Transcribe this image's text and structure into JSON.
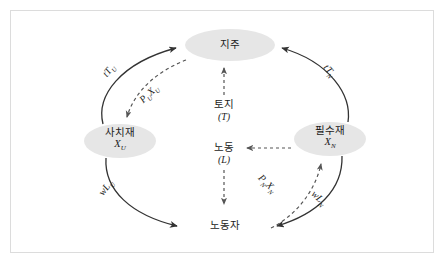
{
  "figure": {
    "type": "circular-flow-diagram",
    "background_color": "#ffffff",
    "frame_border_color": "#dcdcdc",
    "node_fill_color": "#e6e6e6",
    "solid_edge_color": "#333333",
    "dashed_edge_color": "#555555",
    "text_color": "#1b1b1b"
  },
  "nodes": [
    {
      "id": "landlord",
      "name": "지주",
      "symbol": "",
      "position": "top"
    },
    {
      "id": "luxury-goods",
      "name": "사치재",
      "symbol": "X",
      "symbol_sub": "U",
      "position": "left"
    },
    {
      "id": "necessity-goods",
      "name": "필수재",
      "symbol": "X",
      "symbol_sub": "N",
      "position": "right"
    },
    {
      "id": "worker",
      "name": "노동자",
      "symbol": "",
      "position": "bottom"
    }
  ],
  "center_labels": [
    {
      "id": "land",
      "name": "토지",
      "symbol": "(T)"
    },
    {
      "id": "labor",
      "name": "노동",
      "symbol": "(L)"
    }
  ],
  "edge_labels": [
    {
      "id": "tTu",
      "base": "tT",
      "sub": "U"
    },
    {
      "id": "PuXu",
      "base": "P",
      "sub": "U",
      "base2": "X",
      "sub2": "U"
    },
    {
      "id": "tTn",
      "base": "tT",
      "sub": "N"
    },
    {
      "id": "wLu",
      "base": "wL",
      "sub": "U"
    },
    {
      "id": "PnXn",
      "base": "P",
      "sub": "N",
      "base2": "X",
      "sub2": "N"
    },
    {
      "id": "wLn",
      "base": "wL",
      "sub": "N"
    }
  ],
  "edges": [
    {
      "id": "luxury-to-landlord-solid",
      "from": "luxury-goods",
      "to": "landlord",
      "style": "solid",
      "label": "tTu"
    },
    {
      "id": "landlord-to-luxury-dashed",
      "from": "landlord",
      "to": "luxury-goods",
      "style": "dashed",
      "label": "PuXu"
    },
    {
      "id": "necessity-to-landlord-solid",
      "from": "necessity-goods",
      "to": "landlord",
      "style": "solid",
      "label": "tTn"
    },
    {
      "id": "luxury-to-worker-solid",
      "from": "luxury-goods",
      "to": "worker",
      "style": "solid",
      "label": "wLu"
    },
    {
      "id": "necessity-to-worker-solid",
      "from": "necessity-goods",
      "to": "worker",
      "style": "solid",
      "label": "wLn"
    },
    {
      "id": "worker-to-necessity-dashed",
      "from": "worker",
      "to": "necessity-goods",
      "style": "dashed",
      "label": "PnXn"
    },
    {
      "id": "land-up-dashed",
      "from": "land",
      "to": "landlord",
      "style": "dashed",
      "label": ""
    },
    {
      "id": "labor-down-dashed",
      "from": "labor",
      "to": "worker",
      "style": "dashed",
      "label": ""
    },
    {
      "id": "necessity-to-labor-dashed",
      "from": "necessity-goods",
      "to": "labor",
      "style": "dashed",
      "label": ""
    }
  ]
}
